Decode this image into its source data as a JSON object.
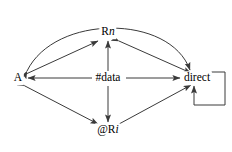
{
  "diagram": {
    "type": "directed-graph",
    "title": "",
    "background_color": "#ffffff",
    "stroke_color": "#3a3a3a",
    "text_color": "#000000",
    "nodes": [
      {
        "id": "A",
        "label": "A",
        "label_plain": "A",
        "x": 18,
        "y": 78
      },
      {
        "id": "Rn",
        "label": "R",
        "label_plain": "Rn",
        "italic_suffix": "n",
        "x": 108,
        "y": 32
      },
      {
        "id": "data",
        "label": "#data",
        "label_plain": "#data",
        "x": 108,
        "y": 78
      },
      {
        "id": "direct",
        "label": "direct",
        "label_plain": "direct",
        "x": 197,
        "y": 78
      },
      {
        "id": "Ri",
        "label": "@R",
        "label_plain": "@Ri",
        "italic_suffix": "i",
        "x": 108,
        "y": 130
      }
    ],
    "edges": [
      {
        "from": "A",
        "to": "direct",
        "style": "curved-arc",
        "arrows": "both",
        "description": "large arc over Rn"
      },
      {
        "from": "A",
        "to": "Rn",
        "style": "straight",
        "arrows": "both",
        "description": "upper-left diagonal"
      },
      {
        "from": "Rn",
        "to": "direct",
        "style": "straight",
        "arrows": "both",
        "description": "upper-right diagonal"
      },
      {
        "from": "A",
        "to": "Ri",
        "style": "straight",
        "arrows": "both",
        "description": "lower-left diagonal"
      },
      {
        "from": "Ri",
        "to": "direct",
        "style": "straight",
        "arrows": "both",
        "description": "lower-right diagonal"
      },
      {
        "from": "data",
        "to": "A",
        "style": "straight",
        "arrows": "forward",
        "description": "horizontal left"
      },
      {
        "from": "data",
        "to": "direct",
        "style": "straight",
        "arrows": "forward",
        "description": "horizontal right"
      },
      {
        "from": "data",
        "to": "Rn",
        "style": "straight",
        "arrows": "forward",
        "description": "vertical up"
      },
      {
        "from": "data",
        "to": "Ri",
        "style": "straight",
        "arrows": "forward",
        "description": "vertical down"
      },
      {
        "from": "direct",
        "to": "direct",
        "style": "self-loop",
        "arrows": "forward",
        "description": "self loop at right, enters from below"
      }
    ]
  }
}
